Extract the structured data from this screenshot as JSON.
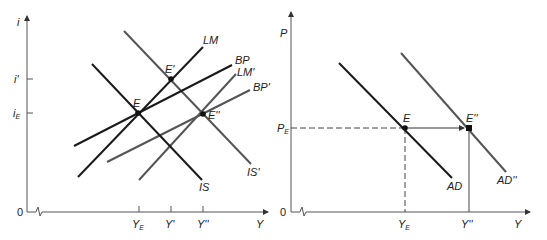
{
  "left_panel": {
    "y_axis_label": "i",
    "x_axis_label": "Y",
    "origin_label": "0",
    "y_ticks": [
      {
        "label": "i'",
        "y": 79
      },
      {
        "label": "i",
        "sub": "E",
        "y": 113
      }
    ],
    "x_ticks": [
      {
        "label": "Y",
        "sub": "E",
        "x": 139
      },
      {
        "label": "Y'",
        "x": 171
      },
      {
        "label": "Y''",
        "x": 203
      }
    ],
    "curves": [
      {
        "name": "IS",
        "color": "#1a1a1a"
      },
      {
        "name": "IS'",
        "color": "#555555"
      },
      {
        "name": "LM",
        "color": "#1a1a1a"
      },
      {
        "name": "LM'",
        "color": "#555555"
      },
      {
        "name": "BP",
        "color": "#1a1a1a"
      },
      {
        "name": "BP'",
        "color": "#555555"
      }
    ],
    "points": [
      {
        "name": "E"
      },
      {
        "name": "E'"
      },
      {
        "name": "E''"
      }
    ]
  },
  "right_panel": {
    "y_axis_label": "P",
    "x_axis_label": "Y",
    "origin_label": "0",
    "y_ticks": [
      {
        "label": "P",
        "sub": "E"
      }
    ],
    "x_ticks": [
      {
        "label": "Y",
        "sub": "E"
      },
      {
        "label": "Y''"
      }
    ],
    "curves": [
      {
        "name": "AD",
        "color": "#1a1a1a"
      },
      {
        "name": "AD''",
        "color": "#555555"
      }
    ],
    "points": [
      {
        "name": "E"
      },
      {
        "name": "E''"
      }
    ]
  }
}
